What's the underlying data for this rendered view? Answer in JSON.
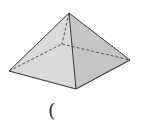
{
  "diagram": {
    "vertices": {
      "apex": [
        69,
        13
      ],
      "base_left": [
        9,
        71
      ],
      "base_front": [
        76,
        89
      ],
      "base_right": [
        130,
        60
      ],
      "base_back_hidden": [
        62,
        44
      ]
    },
    "colors": {
      "edge": "#3a3a3a",
      "hidden_edge": "#4a4a4a",
      "face_left": "#d9d9d9",
      "face_right": "#c4c4c4",
      "background": "#ffffff"
    },
    "hidden_edges": [
      "apex-back",
      "left-back",
      "back-right"
    ],
    "visible_edges": [
      "apex-left",
      "apex-front",
      "apex-right",
      "left-front",
      "front-right"
    ]
  },
  "caption": {
    "text": "("
  }
}
